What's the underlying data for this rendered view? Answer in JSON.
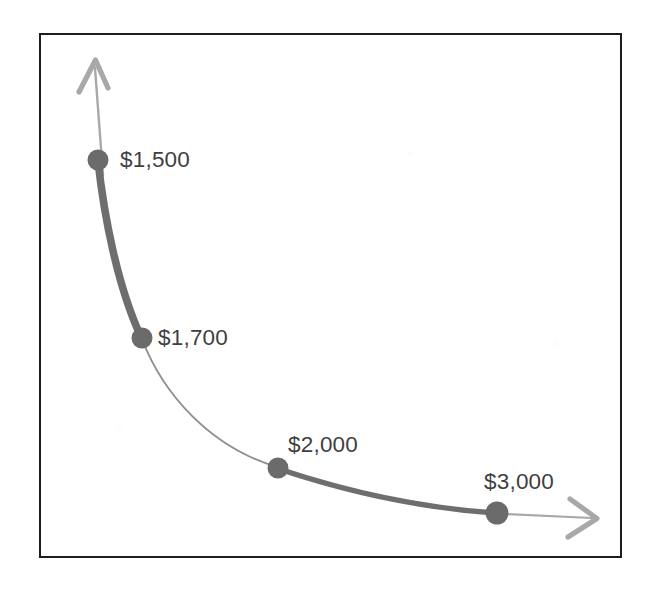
{
  "chart_data": {
    "type": "line",
    "title": "",
    "subtitle": "",
    "xlabel": "",
    "ylabel": "",
    "grid": false,
    "legend": null,
    "axis_style": "arrow-axes-no-ticks",
    "annotations": [
      "$1,500",
      "$1,700",
      "$2,000",
      "$3,000"
    ],
    "categories": [
      "$1,500",
      "$1,700",
      "$2,000",
      "$3,000"
    ],
    "values": [
      1500,
      1700,
      2000,
      3000
    ],
    "series": [
      {
        "name": "price-quantity-curve",
        "points": [
          {
            "label": "$1,500",
            "value": 1500,
            "x": 98,
            "y": 160
          },
          {
            "label": "$1,700",
            "value": 1700,
            "x": 142,
            "y": 338
          },
          {
            "label": "$2,000",
            "value": 2000,
            "x": 278,
            "y": 468
          },
          {
            "label": "$3,000",
            "value": 3000,
            "x": 497,
            "y": 513
          }
        ]
      }
    ],
    "segments": [
      {
        "from": "$1,500",
        "to": "$1,700",
        "emphasis": "thick"
      },
      {
        "from": "$1,700",
        "to": "$2,000",
        "emphasis": "thin"
      },
      {
        "from": "$2,000",
        "to": "$3,000",
        "emphasis": "thick"
      }
    ],
    "colors": {
      "marker": "#6b6b6b",
      "curve_thick": "#6e6e6e",
      "curve_thin": "#8f8f8f",
      "axis": "#a8a8a8",
      "label_text": "#3f3f3f",
      "frame": "#1d1d1d",
      "background": "#ffffff"
    }
  },
  "labels": {
    "p1": "$1,500",
    "p2": "$1,700",
    "p3": "$2,000",
    "p4": "$3,000"
  }
}
